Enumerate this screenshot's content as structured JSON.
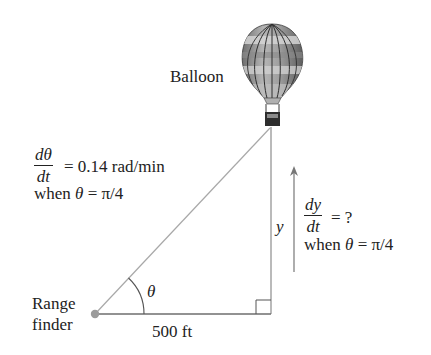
{
  "diagram": {
    "balloon_label": "Balloon",
    "rate_theta": {
      "numerator": "dθ",
      "denominator": "dt",
      "equals": "= 0.14  rad/min",
      "condition_prefix": "when",
      "condition_var": "θ",
      "condition_rest": "= π/4"
    },
    "rate_y": {
      "numerator": "dy",
      "denominator": "dt",
      "equals": "= ?",
      "condition_prefix": "when",
      "condition_var": "θ",
      "condition_rest": "= π/4"
    },
    "height_label": "y",
    "angle_label": "θ",
    "base_label": "500 ft",
    "observer_label_line1": "Range",
    "observer_label_line2": "finder",
    "colors": {
      "line": "#9a9a9a",
      "dot": "#9a9a9a",
      "text": "#222222",
      "balloon_dark": "#6e6e6e",
      "balloon_light": "#c8c8c8"
    }
  }
}
